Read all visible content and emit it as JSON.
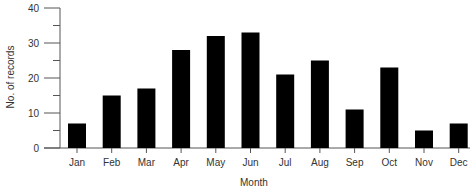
{
  "chart_data": {
    "type": "bar",
    "title": "",
    "xlabel": "Month",
    "ylabel": "No. of records",
    "categories": [
      "Jan",
      "Feb",
      "Mar",
      "Apr",
      "May",
      "Jun",
      "Jul",
      "Aug",
      "Sep",
      "Oct",
      "Nov",
      "Dec"
    ],
    "values": [
      7,
      15,
      17,
      28,
      32,
      33,
      21,
      25,
      11,
      23,
      5,
      7
    ],
    "ylim": [
      0,
      40
    ],
    "yticks": [
      0,
      10,
      20,
      30,
      40
    ],
    "grid": false,
    "legend": null,
    "bar_color": "#000000"
  }
}
